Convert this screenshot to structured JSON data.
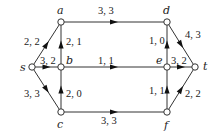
{
  "nodes": [
    {
      "id": "s",
      "label": "s",
      "x": 32,
      "y": 67,
      "lx": 20,
      "ly": 71
    },
    {
      "id": "a",
      "label": "a",
      "x": 61,
      "y": 22,
      "lx": 57,
      "ly": 14
    },
    {
      "id": "b",
      "label": "b",
      "x": 61,
      "y": 67,
      "lx": 66,
      "ly": 64
    },
    {
      "id": "c",
      "label": "c",
      "x": 61,
      "y": 112,
      "lx": 57,
      "ly": 128
    },
    {
      "id": "d",
      "label": "d",
      "x": 167,
      "y": 22,
      "lx": 163,
      "ly": 14
    },
    {
      "id": "e",
      "label": "e",
      "x": 167,
      "y": 67,
      "lx": 156,
      "ly": 64
    },
    {
      "id": "f",
      "label": "f",
      "x": 167,
      "y": 112,
      "lx": 164,
      "ly": 129
    },
    {
      "id": "t",
      "label": "t",
      "x": 195,
      "y": 67,
      "lx": 203,
      "ly": 70
    }
  ],
  "edges": [
    {
      "from": "s",
      "to": "a",
      "label": "2, 2",
      "lx": 24,
      "ly": 45
    },
    {
      "from": "s",
      "to": "b",
      "label": "3, 2",
      "lx": 40,
      "ly": 64
    },
    {
      "from": "s",
      "to": "c",
      "label": "3, 3",
      "lx": 24,
      "ly": 97
    },
    {
      "from": "b",
      "to": "a",
      "label": "2, 1",
      "lx": 66,
      "ly": 45
    },
    {
      "from": "c",
      "to": "b",
      "label": "2, 0",
      "lx": 66,
      "ly": 97
    },
    {
      "from": "a",
      "to": "d",
      "label": "3, 3",
      "lx": 98,
      "ly": 14
    },
    {
      "from": "b",
      "to": "e",
      "label": "1, 1",
      "lx": 98,
      "ly": 64
    },
    {
      "from": "c",
      "to": "f",
      "label": "3, 3",
      "lx": 101,
      "ly": 124
    },
    {
      "from": "e",
      "to": "d",
      "label": "1, 0",
      "lx": 149,
      "ly": 44
    },
    {
      "from": "f",
      "to": "e",
      "label": "1, 1",
      "lx": 149,
      "ly": 94
    },
    {
      "from": "d",
      "to": "t",
      "label": "4, 3",
      "lx": 185,
      "ly": 38
    },
    {
      "from": "e",
      "to": "t",
      "label": "3, 2",
      "lx": 171,
      "ly": 64
    },
    {
      "from": "f",
      "to": "t",
      "label": "2, 2",
      "lx": 185,
      "ly": 97
    }
  ]
}
